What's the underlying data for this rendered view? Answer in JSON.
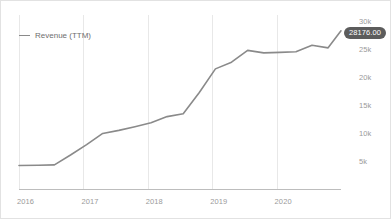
{
  "chart_data": {
    "type": "line",
    "title": "",
    "xlabel": "",
    "ylabel": "",
    "legend_position": "top-left",
    "grid": "vertical-only",
    "y_axis_side": "right",
    "xlim": [
      2016.0,
      2021.0
    ],
    "ylim": [
      0,
      31000
    ],
    "x_ticks": [
      "2016",
      "2017",
      "2018",
      "2019",
      "2020"
    ],
    "x_tick_values": [
      2016,
      2017,
      2018,
      2019,
      2020
    ],
    "y_ticks": [
      "5k",
      "10k",
      "15k",
      "20k",
      "25k",
      "30k"
    ],
    "y_tick_values": [
      5000,
      10000,
      15000,
      20000,
      25000,
      30000
    ],
    "series": [
      {
        "name": "Revenue (TTM)",
        "color": "#8a8a8a",
        "x": [
          2016.0,
          2016.3,
          2016.55,
          2016.8,
          2017.05,
          2017.3,
          2017.55,
          2017.8,
          2018.05,
          2018.3,
          2018.55,
          2018.8,
          2019.05,
          2019.3,
          2019.55,
          2019.8,
          2020.05,
          2020.3,
          2020.55,
          2020.8,
          2021.0
        ],
        "values": [
          4180,
          4220,
          4300,
          6050,
          7900,
          9900,
          10450,
          11100,
          11800,
          12900,
          13400,
          17200,
          21400,
          22600,
          24700,
          24250,
          24350,
          24450,
          25600,
          25150,
          28176
        ]
      }
    ],
    "annotations": [
      {
        "type": "value-badge",
        "label": "28176.00",
        "value": 28176.0,
        "attached_to": "Revenue (TTM)",
        "position": "series-end",
        "background": "#5c5c5c",
        "text_color": "#ffffff"
      }
    ]
  },
  "legend": {
    "entries": [
      {
        "label": "Revenue (TTM)",
        "color": "#8a8a8a"
      }
    ]
  },
  "badge": {
    "text": "28176.00"
  },
  "colors": {
    "series": "#8a8a8a",
    "gridline": "#e8e8e8",
    "axis": "#bdbdbd",
    "tick_text": "#9a9a9a",
    "legend_text": "#6e6e6e",
    "badge_bg": "#5c5c5c",
    "card_border": "#e2e2e2",
    "background": "#ffffff"
  }
}
